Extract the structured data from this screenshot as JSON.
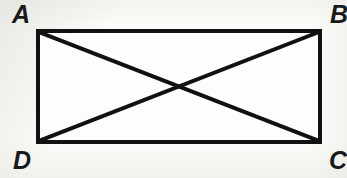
{
  "figure": {
    "kind": "geometry-diagram",
    "shape": "rectangle-with-diagonals",
    "stroke_color": "#111111",
    "fill_color": "#fdfdfb",
    "background_color": "#f7f7f5",
    "border_width_px": 4,
    "diagonal_width_px": 4,
    "labels": {
      "top_left": "A",
      "top_right": "B",
      "bottom_right": "C",
      "bottom_left": "D"
    },
    "geometry": {
      "x_left": 36,
      "x_right": 322,
      "y_top": 29,
      "y_bottom": 144,
      "width": 286,
      "height": 115,
      "diagonal_1": "A-C",
      "diagonal_2": "B-D",
      "intersection": {
        "x": 179,
        "y": 86
      }
    }
  }
}
